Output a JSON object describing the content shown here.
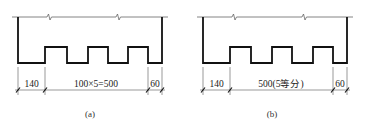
{
  "figures": [
    {
      "id": "a",
      "caption": "(a)",
      "dimensions": {
        "left": "140",
        "middle": "100×5=500",
        "right": "60"
      }
    },
    {
      "id": "b",
      "caption": "(b)",
      "dimensions": {
        "left": "140",
        "middle": "500(5等分)",
        "right": "60"
      }
    }
  ],
  "colors": {
    "outline": "#111111",
    "thin_line": "#555555",
    "background": "#ffffff"
  }
}
